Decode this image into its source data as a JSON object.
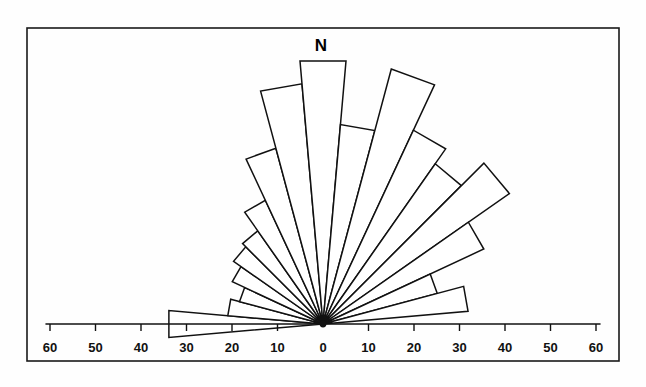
{
  "figure": {
    "north_label": "N",
    "frame": {
      "x": 27,
      "y": 28,
      "width": 592,
      "height": 333
    },
    "center": {
      "x": 323,
      "y": 324
    },
    "px_per_unit": 4.55,
    "colors": {
      "stroke": "#111111",
      "fill": "#ffffff",
      "background": "#fefefe"
    }
  },
  "axis": {
    "labels": [
      "60",
      "50",
      "40",
      "30",
      "20",
      "10",
      "0",
      "10",
      "20",
      "30",
      "40",
      "50",
      "60"
    ],
    "values": [
      -60,
      -50,
      -40,
      -30,
      -20,
      -10,
      0,
      10,
      20,
      30,
      40,
      50,
      60
    ],
    "tick_y": 324,
    "label_y": 352,
    "tick_length": 7,
    "left_end": -61,
    "right_end": 61
  },
  "chart_data": {
    "type": "bar",
    "subtype": "rose-diagram",
    "title": "",
    "subtitle": "",
    "xlabel": "",
    "ylabel": "",
    "grid": false,
    "legend": null,
    "orientation": "upper-half-circle",
    "bin_width_deg": 10,
    "bin_count": 18,
    "radial_unit_range": [
      0,
      60
    ],
    "axis_tick_values": [
      -60,
      -50,
      -40,
      -30,
      -20,
      -10,
      0,
      10,
      20,
      30,
      40,
      50,
      60
    ],
    "north_at_deg": 0,
    "categories": [
      "265-275",
      "275-285",
      "285-295",
      "295-305",
      "305-315",
      "315-325",
      "325-335",
      "335-345",
      "345-355",
      "355-005",
      "005-015",
      "015-025",
      "025-035",
      "035-045",
      "045-055",
      "055-065",
      "065-075",
      "075-085"
    ],
    "bearing_mid_deg": [
      -90,
      -80,
      -70,
      -60,
      -50,
      -40,
      -30,
      -20,
      -10,
      0,
      10,
      20,
      30,
      40,
      50,
      60,
      70,
      80
    ],
    "values": [
      34,
      21,
      19,
      22,
      24,
      25,
      30,
      40,
      53,
      58,
      44,
      58,
      47,
      43,
      50,
      39,
      26,
      32
    ],
    "max_value": 58
  }
}
